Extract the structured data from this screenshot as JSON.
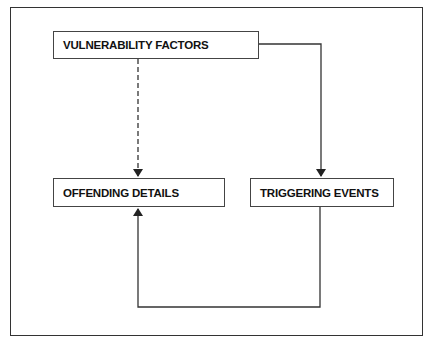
{
  "diagram": {
    "nodes": [
      {
        "id": "vulnerability",
        "label": "VULNERABILITY FACTORS"
      },
      {
        "id": "offending",
        "label": "OFFENDING DETAILS"
      },
      {
        "id": "triggering",
        "label": "TRIGGERING EVENTS"
      }
    ],
    "edges": [
      {
        "from": "vulnerability",
        "to": "offending",
        "style": "dashed",
        "arrow": true
      },
      {
        "from": "vulnerability",
        "to": "triggering",
        "style": "solid",
        "arrow": true
      },
      {
        "from": "triggering",
        "to": "offending",
        "style": "solid",
        "arrow": true,
        "route": "loop-below"
      }
    ],
    "colors": {
      "line": "#333333",
      "background": "#ffffff"
    }
  }
}
